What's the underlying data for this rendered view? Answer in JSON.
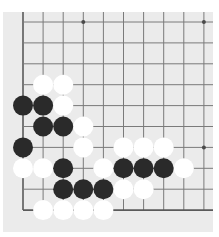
{
  "board": {
    "size_visible": {
      "cols": 10,
      "rows": 10
    },
    "origin": {
      "x": 23,
      "y": 22
    },
    "spacing": {
      "x": 20.1,
      "y": 20.9
    },
    "line_extent": {
      "top": 12,
      "right": 213
    },
    "edges": [
      "left",
      "bottom"
    ],
    "colors": {
      "background": "#ebebeb",
      "line": "#7a7a7a",
      "edge_line": "#5a5a5a",
      "black_stone": "#2a2a2a",
      "white_stone": "#ffffff",
      "star_point": "#4a4a4a"
    },
    "star_points": [
      {
        "col": 3,
        "row": 0
      },
      {
        "col": 9,
        "row": 0
      },
      {
        "col": 9,
        "row": 6
      }
    ],
    "stones": [
      {
        "col": 1,
        "row": 3,
        "color": "white"
      },
      {
        "col": 2,
        "row": 3,
        "color": "white"
      },
      {
        "col": 0,
        "row": 4,
        "color": "black"
      },
      {
        "col": 1,
        "row": 4,
        "color": "black"
      },
      {
        "col": 2,
        "row": 4,
        "color": "white"
      },
      {
        "col": 1,
        "row": 5,
        "color": "black"
      },
      {
        "col": 2,
        "row": 5,
        "color": "black"
      },
      {
        "col": 3,
        "row": 5,
        "color": "white"
      },
      {
        "col": 0,
        "row": 6,
        "color": "black"
      },
      {
        "col": 3,
        "row": 6,
        "color": "white"
      },
      {
        "col": 5,
        "row": 6,
        "color": "white"
      },
      {
        "col": 6,
        "row": 6,
        "color": "white"
      },
      {
        "col": 7,
        "row": 6,
        "color": "white"
      },
      {
        "col": 0,
        "row": 7,
        "color": "white"
      },
      {
        "col": 1,
        "row": 7,
        "color": "white"
      },
      {
        "col": 2,
        "row": 7,
        "color": "black"
      },
      {
        "col": 4,
        "row": 7,
        "color": "white"
      },
      {
        "col": 5,
        "row": 7,
        "color": "black"
      },
      {
        "col": 6,
        "row": 7,
        "color": "black"
      },
      {
        "col": 7,
        "row": 7,
        "color": "black"
      },
      {
        "col": 8,
        "row": 7,
        "color": "white"
      },
      {
        "col": 2,
        "row": 8,
        "color": "black"
      },
      {
        "col": 3,
        "row": 8,
        "color": "black"
      },
      {
        "col": 4,
        "row": 8,
        "color": "black"
      },
      {
        "col": 5,
        "row": 8,
        "color": "white"
      },
      {
        "col": 6,
        "row": 8,
        "color": "white"
      },
      {
        "col": 1,
        "row": 9,
        "color": "white"
      },
      {
        "col": 2,
        "row": 9,
        "color": "white"
      },
      {
        "col": 3,
        "row": 9,
        "color": "white"
      },
      {
        "col": 4,
        "row": 9,
        "color": "white"
      }
    ]
  }
}
